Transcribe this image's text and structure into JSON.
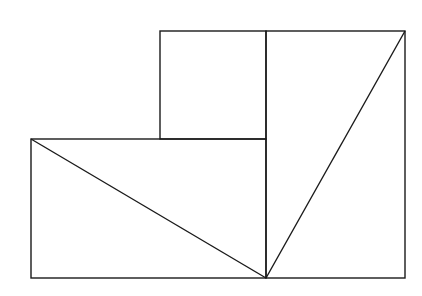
{
  "diagram": {
    "stroke_color": "#1a1a1a",
    "background": "#ffffff",
    "shapes": {
      "small_square": {
        "x": 160,
        "y": 31,
        "w": 106,
        "h": 108
      },
      "lower_left_rect": {
        "x": 31,
        "y": 139,
        "w": 235,
        "h": 139
      },
      "right_rect": {
        "x": 266,
        "y": 31,
        "w": 139,
        "h": 247
      },
      "diagonal_left": {
        "x1": 31,
        "y1": 139,
        "x2": 266,
        "y2": 278
      },
      "diagonal_right": {
        "x1": 266,
        "y1": 278,
        "x2": 405,
        "y2": 31
      }
    }
  }
}
